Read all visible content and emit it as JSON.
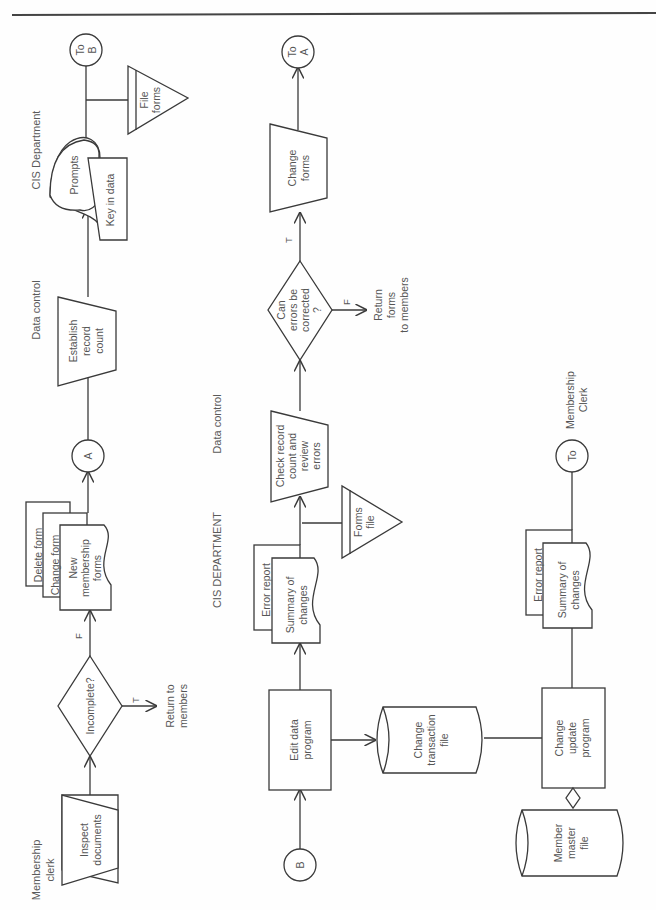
{
  "diagram": {
    "type": "system-flowchart",
    "orientation": "rotated-90-ccw",
    "colors": {
      "line": "#3a3a3a",
      "text": "#555555",
      "background": "#ffffff"
    },
    "lanes": {
      "membership_clerk": "Membership clerk",
      "membership_clerk_l1": "Membership",
      "membership_clerk_l2": "clerk",
      "data_control_top": "Data control",
      "cis_department_top": "CIS Department",
      "cis_department_bottom": "CIS DEPARTMENT",
      "data_control_bottom": "Data control"
    },
    "nodes": {
      "inspect_documents": {
        "shape": "manual-operation",
        "l1": "Inspect",
        "l2": "documents"
      },
      "incomplete": {
        "shape": "decision",
        "label": "Incomplete?"
      },
      "return_to_members": {
        "shape": "terminal-text",
        "l1": "Return to",
        "l2": "members"
      },
      "forms_stack": {
        "shape": "document-stack",
        "delete_form": "Delete form",
        "change_form": "Change form",
        "new_l1": "New",
        "new_l2": "membership",
        "new_l3": "forms"
      },
      "connector_a": {
        "shape": "connector",
        "label": "A"
      },
      "establish_record_count": {
        "shape": "manual-operation",
        "l1": "Establish",
        "l2": "record",
        "l3": "count"
      },
      "prompts": {
        "shape": "display",
        "label": "Prompts"
      },
      "key_in_data": {
        "shape": "manual-input",
        "label": "Key in data"
      },
      "file_forms": {
        "shape": "offline-storage",
        "l1": "File",
        "l2": "forms"
      },
      "to_b": {
        "shape": "connector",
        "l1": "To",
        "l2": "B"
      },
      "connector_b": {
        "shape": "connector",
        "label": "B"
      },
      "edit_data_program": {
        "shape": "process",
        "l1": "Edit data",
        "l2": "program"
      },
      "summary_error_1": {
        "shape": "document-stack",
        "error_report": "Error report",
        "sum_l1": "Summary of",
        "sum_l2": "changes"
      },
      "forms_file": {
        "shape": "offline-storage",
        "l1": "Forms",
        "l2": "file"
      },
      "check_record_count": {
        "shape": "manual-operation",
        "l1": "Check record",
        "l2": "count and",
        "l3": "review",
        "l4": "errors"
      },
      "can_errors_be_corrected": {
        "shape": "decision",
        "l1": "Can",
        "l2": "errors be",
        "l3": "corrected",
        "l4": "?"
      },
      "return_forms": {
        "shape": "terminal-text",
        "l1": "Return",
        "l2": "forms",
        "l3": "to members"
      },
      "change_forms": {
        "shape": "manual-operation",
        "l1": "Change",
        "l2": "forms"
      },
      "to_a": {
        "shape": "connector",
        "l1": "To",
        "l2": "A"
      },
      "change_transaction_file": {
        "shape": "disk",
        "l1": "Change",
        "l2": "transaction",
        "l3": "file"
      },
      "change_update_program": {
        "shape": "process",
        "l1": "Change",
        "l2": "update",
        "l3": "program"
      },
      "member_master_file": {
        "shape": "disk",
        "l1": "Member",
        "l2": "master",
        "l3": "file"
      },
      "summary_error_2": {
        "shape": "document-stack",
        "error_report": "Error report",
        "sum_l1": "Summary of",
        "sum_l2": "changes"
      },
      "to_membership_clerk": {
        "shape": "connector",
        "label": "To",
        "dest_l1": "Membership",
        "dest_l2": "Clerk"
      }
    },
    "edge_labels": {
      "incomplete_true": "T",
      "incomplete_false": "F",
      "correct_true": "T",
      "correct_false": "F"
    }
  }
}
